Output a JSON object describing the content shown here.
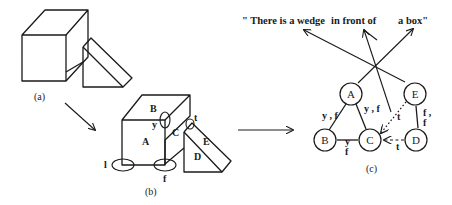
{
  "diagram": {
    "panels": [
      {
        "id": "a",
        "caption": "(a)"
      },
      {
        "id": "b",
        "caption": "(b)"
      },
      {
        "id": "c",
        "caption": "(c)"
      }
    ],
    "panel_b": {
      "region_labels": [
        "A",
        "B",
        "C",
        "D",
        "E"
      ],
      "junction_labels": {
        "l": "l",
        "y": "y",
        "f": "f",
        "t": "t"
      }
    },
    "sentence": {
      "part1": "\" There is a wedge",
      "part2": "in front of",
      "part3": "a box\""
    },
    "graph": {
      "nodes": [
        "A",
        "B",
        "C",
        "D",
        "E"
      ],
      "edges": [
        {
          "from": "A",
          "to": "B",
          "label": "y , f",
          "style": "solid"
        },
        {
          "from": "A",
          "to": "C",
          "label": "y , f",
          "style": "solid"
        },
        {
          "from": "B",
          "to": "C",
          "label_top": "y",
          "label_bottom": "f",
          "style": "solid"
        },
        {
          "from": "E",
          "to": "D",
          "label_top": "f ,",
          "label_bottom": "f",
          "style": "solid"
        },
        {
          "from": "E",
          "to": "C",
          "label": "t",
          "style": "dotted-arrow"
        },
        {
          "from": "D",
          "to": "C",
          "label": "t",
          "style": "dashed-arrow"
        }
      ]
    }
  }
}
